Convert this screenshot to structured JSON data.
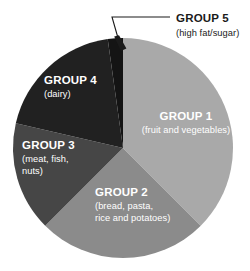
{
  "chart_data": {
    "type": "pie",
    "title": "",
    "subtitle": "",
    "xlabel": "",
    "ylabel": "",
    "legend_position": "none",
    "grid": false,
    "center": {
      "x": 123,
      "y": 148
    },
    "radius": 110,
    "start_angle_deg": 0,
    "direction": "clockwise",
    "categories": [
      "GROUP 1",
      "GROUP 2",
      "GROUP 3",
      "GROUP 4",
      "GROUP 5"
    ],
    "values": [
      37.5,
      25.0,
      16.1,
      19.2,
      2.2
    ],
    "slices": [
      {
        "name": "GROUP 1",
        "label": "GROUP 1",
        "sublabel": "(fruit and vegetables)",
        "value": 37.5,
        "start_deg": 0,
        "end_deg": 135,
        "color": "#a9a9a9",
        "label_color": "#ffffff",
        "label_placement": "inside",
        "label_x": 186,
        "label_y": 120,
        "sublabel_x": 186,
        "sublabel_y": 133,
        "label_anchor": "middle"
      },
      {
        "name": "GROUP 2",
        "label": "GROUP 2",
        "sublabel_line1": "(bread, pasta,",
        "sublabel_line2": "rice and potatoes)",
        "value": 25.0,
        "start_deg": 135,
        "end_deg": 225,
        "color": "#8b8b8b",
        "label_color": "#ffffff",
        "label_placement": "inside",
        "label_x": 95,
        "label_y": 196,
        "sublabel_x": 95,
        "sublabel_y": 209,
        "sublabel2_x": 95,
        "sublabel2_y": 221,
        "label_anchor": "start"
      },
      {
        "name": "GROUP 3",
        "label": "GROUP 3",
        "sublabel_line1": "(meat, fish,",
        "sublabel_line2": "nuts)",
        "value": 16.1,
        "start_deg": 225,
        "end_deg": 283,
        "color": "#464646",
        "label_color": "#ffffff",
        "label_placement": "inside",
        "label_x": 22,
        "label_y": 149,
        "sublabel_x": 22,
        "sublabel_y": 162,
        "sublabel2_x": 22,
        "sublabel2_y": 174,
        "label_anchor": "start"
      },
      {
        "name": "GROUP 4",
        "label": "GROUP 4",
        "sublabel": "(dairy)",
        "value": 19.2,
        "start_deg": 283,
        "end_deg": 352,
        "color": "#212121",
        "label_color": "#ffffff",
        "label_placement": "inside",
        "label_x": 44,
        "label_y": 84,
        "sublabel_x": 44,
        "sublabel_y": 97,
        "label_anchor": "start"
      },
      {
        "name": "GROUP 5",
        "label": "GROUP 5",
        "sublabel": "(high fat/sugar)",
        "value": 2.2,
        "start_deg": 352,
        "end_deg": 360,
        "color": "#141414",
        "label_color": "#1a1a1a",
        "label_placement": "callout",
        "label_x": 176,
        "label_y": 22,
        "sublabel_x": 176,
        "sublabel_y": 36,
        "label_anchor": "start"
      }
    ],
    "annotations": [
      {
        "name": "group5-leader-line",
        "target_slice": "GROUP 5",
        "path": "M 170 17 L 112 17 L 120 45",
        "arrow_tip": {
          "x": 121,
          "y": 50
        }
      }
    ]
  },
  "background_color": "#ffffff"
}
